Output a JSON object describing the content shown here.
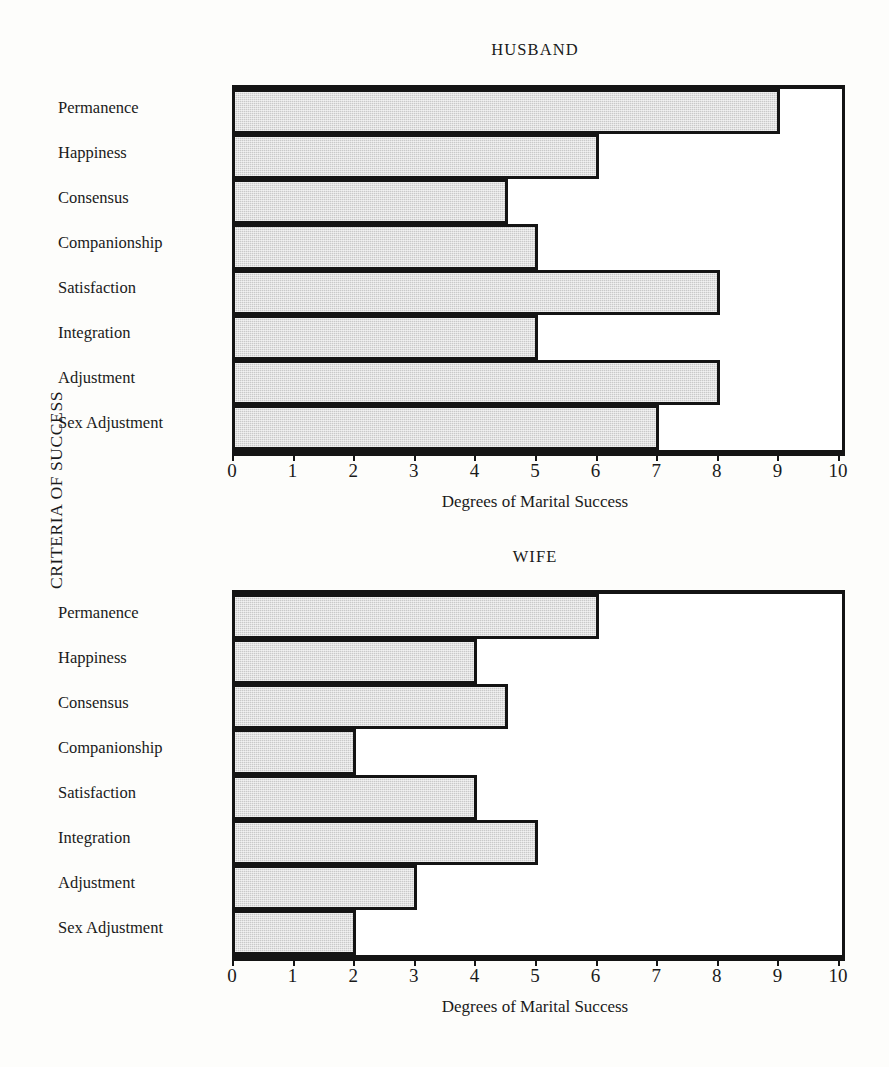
{
  "figure": {
    "y_axis_caption": "CRITERIA OF SUCCESS",
    "x_axis_caption": "Degrees of Marital Success",
    "tick_labels": [
      "0",
      "1",
      "2",
      "3",
      "4",
      "5",
      "6",
      "7",
      "8",
      "9",
      "10"
    ],
    "bar_fill_color": "#c9c9c9",
    "bar_outline_color": "#141414",
    "background_color": "#fdfdfb"
  },
  "panels": [
    {
      "title": "HUSBAND"
    },
    {
      "title": "WIFE"
    }
  ],
  "chart_data": [
    {
      "type": "bar",
      "orientation": "horizontal",
      "title": "HUSBAND",
      "xlabel": "Degrees of Marital Success",
      "ylabel": "CRITERIA OF SUCCESS",
      "xlim": [
        0,
        10
      ],
      "xticks": [
        0,
        1,
        2,
        3,
        4,
        5,
        6,
        7,
        8,
        9,
        10
      ],
      "grid": false,
      "legend": "none",
      "categories": [
        "Permanence",
        "Happiness",
        "Consensus",
        "Companionship",
        "Satisfaction",
        "Integration",
        "Adjustment",
        "Sex Adjustment"
      ],
      "values": [
        9,
        6,
        4.5,
        5,
        8,
        5,
        8,
        7
      ]
    },
    {
      "type": "bar",
      "orientation": "horizontal",
      "title": "WIFE",
      "xlabel": "Degrees of Marital Success",
      "ylabel": "CRITERIA OF SUCCESS",
      "xlim": [
        0,
        10
      ],
      "xticks": [
        0,
        1,
        2,
        3,
        4,
        5,
        6,
        7,
        8,
        9,
        10
      ],
      "grid": false,
      "legend": "none",
      "categories": [
        "Permanence",
        "Happiness",
        "Consensus",
        "Companionship",
        "Satisfaction",
        "Integration",
        "Adjustment",
        "Sex Adjustment"
      ],
      "values": [
        6,
        4,
        4.5,
        2,
        4,
        5,
        3,
        2
      ]
    }
  ]
}
